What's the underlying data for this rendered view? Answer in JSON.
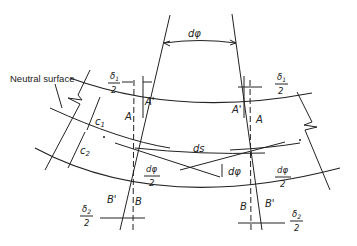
{
  "figure": {
    "type": "beam-bending-element-diagram",
    "labels": {
      "neutral_surface": "Neutral surface",
      "d_phi": "dφ",
      "ds": "ds",
      "c1": "c",
      "c1_sub": "1",
      "c2": "c",
      "c2_sub": "2",
      "A": "A",
      "A_prime": "A'",
      "B": "B",
      "B_prime": "B'",
      "delta1_num": "δ",
      "delta1_sub": "1",
      "delta2_num": "δ",
      "delta2_sub": "2",
      "half_den": "2",
      "dphi_num": "dφ"
    },
    "colors": {
      "line": "#222222",
      "background": "#ffffff"
    }
  }
}
